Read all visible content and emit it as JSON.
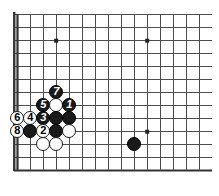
{
  "figure": {
    "kind": "go-board-diagram",
    "title": "",
    "board": {
      "grid_spacing_px": 13,
      "origin_x_px": 17,
      "origin_y_px": 14,
      "cols": 15,
      "rows": 13,
      "line_color": "#4d4d4d",
      "border_color": "#333333",
      "background_color": "#ffffff",
      "edges": {
        "left": true,
        "bottom": true,
        "top": false,
        "right": false
      },
      "star_points": [
        {
          "col": 3,
          "row": 2
        },
        {
          "col": 10,
          "row": 2
        },
        {
          "col": 10,
          "row": 9
        }
      ]
    },
    "stones": [
      {
        "id": "s-7",
        "color": "black",
        "label": "7",
        "col": 3,
        "row": 6
      },
      {
        "id": "s-5",
        "color": "black",
        "label": "5",
        "col": 2,
        "row": 7
      },
      {
        "id": "s-w1",
        "color": "white",
        "label": "",
        "col": 3,
        "row": 7
      },
      {
        "id": "s-1",
        "color": "black",
        "label": "1",
        "col": 4,
        "row": 7
      },
      {
        "id": "s-6",
        "color": "white",
        "label": "6",
        "col": 0,
        "row": 8
      },
      {
        "id": "s-4",
        "color": "white",
        "label": "4",
        "col": 1,
        "row": 8
      },
      {
        "id": "s-3",
        "color": "black",
        "label": "3",
        "col": 2,
        "row": 8
      },
      {
        "id": "s-b1",
        "color": "black",
        "label": "",
        "col": 3,
        "row": 8
      },
      {
        "id": "s-b2",
        "color": "black",
        "label": "",
        "col": 4,
        "row": 8
      },
      {
        "id": "s-8",
        "color": "white",
        "label": "8",
        "col": 0,
        "row": 9
      },
      {
        "id": "s-b3",
        "color": "black",
        "label": "",
        "col": 1,
        "row": 9
      },
      {
        "id": "s-2",
        "color": "white",
        "label": "2",
        "col": 2,
        "row": 9
      },
      {
        "id": "s-b4",
        "color": "black",
        "label": "",
        "col": 3,
        "row": 9
      },
      {
        "id": "s-w2",
        "color": "white",
        "label": "",
        "col": 4,
        "row": 9
      },
      {
        "id": "s-w3",
        "color": "white",
        "label": "",
        "col": 2,
        "row": 10
      },
      {
        "id": "s-w4",
        "color": "white",
        "label": "",
        "col": 3,
        "row": 10
      },
      {
        "id": "s-b5",
        "color": "black",
        "label": "",
        "col": 9,
        "row": 10
      }
    ],
    "stone_radius_px": 7.4,
    "colors": {
      "black_stone": "#1a1a1a",
      "white_stone": "#ffffff",
      "white_stone_border": "#1a1a1a",
      "black_label": "#ffffff",
      "white_label": "#000000"
    }
  }
}
